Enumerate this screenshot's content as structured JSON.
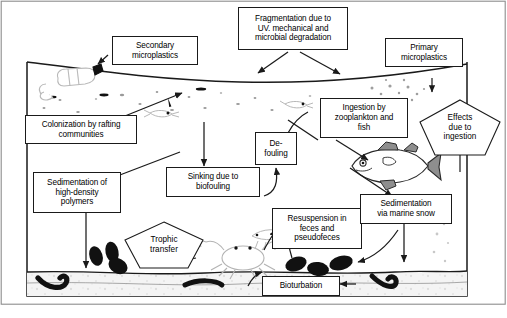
{
  "figure": {
    "caption": "",
    "frame": {
      "water_surface_label": "sea surface",
      "seabed_label": "sediment"
    },
    "colors": {
      "line": "#1a1a1a",
      "box_fill": "#ffffff",
      "water": "#ffffff",
      "sediment": "#f2f2f2",
      "organism_gray": "#b5b5b5",
      "organism_dark": "#111111"
    }
  },
  "nodes": [
    {
      "id": "secondary",
      "label": "Secondary\nmicroplastics",
      "shape": "rect"
    },
    {
      "id": "fragmentation",
      "label": "Fragmentation due to\nUV. mechanical and\nmicrobial degradation",
      "shape": "rect"
    },
    {
      "id": "primary",
      "label": "Primary\nmicroplastics",
      "shape": "rect"
    },
    {
      "id": "colonization",
      "label": "Colonization by rafting\ncommunities",
      "shape": "rect"
    },
    {
      "id": "ingestion",
      "label": "Ingestion by\nzooplankton and\nfish",
      "shape": "rect"
    },
    {
      "id": "defouling",
      "label": "De-\nfouling",
      "shape": "rect"
    },
    {
      "id": "sinking",
      "label": "Sinking due to\nbiofouling",
      "shape": "rect"
    },
    {
      "id": "sedimentation_hd",
      "label": "Sedimentation of\nhigh-density\npolymers",
      "shape": "rect"
    },
    {
      "id": "resuspension",
      "label": "Resuspension in\nfeces and\npseudofeces",
      "shape": "rect"
    },
    {
      "id": "marine_snow",
      "label": "Sedimentation\nvia marine snow",
      "shape": "rect"
    },
    {
      "id": "bioturbation",
      "label": "Bioturbation",
      "shape": "rect"
    },
    {
      "id": "trophic",
      "label": "Trophic\ntransfer",
      "shape": "pentagon"
    },
    {
      "id": "effects",
      "label": "Effects\ndue to\ningestion",
      "shape": "pentagon"
    }
  ],
  "organisms": [
    {
      "id": "bottle",
      "name": "plastic-bottle"
    },
    {
      "id": "fish",
      "name": "fish"
    },
    {
      "id": "crab",
      "name": "crab"
    },
    {
      "id": "shrimp",
      "name": "shrimp"
    },
    {
      "id": "zooplankton",
      "name": "zooplankton"
    },
    {
      "id": "worm-left",
      "name": "benthic-worm"
    },
    {
      "id": "worm-right",
      "name": "benthic-worm"
    },
    {
      "id": "mussels",
      "name": "mussel-cluster"
    },
    {
      "id": "fecal-pellets",
      "name": "fecal-pellet-cluster"
    }
  ]
}
